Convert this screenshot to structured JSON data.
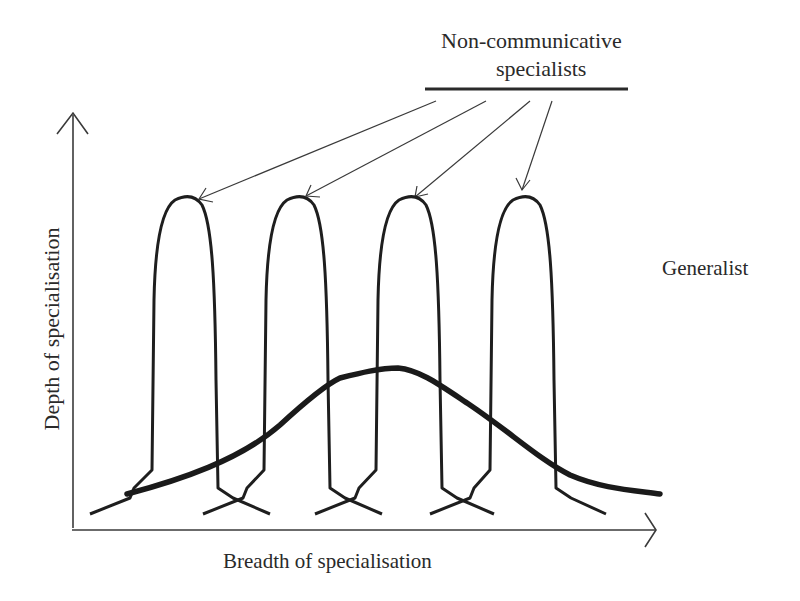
{
  "diagram": {
    "title": {
      "line1": "Non-communicative",
      "line2": "specialists"
    },
    "generalist_label": "Generalist",
    "x_axis_label": "Breadth of specialisation",
    "y_axis_label": "Depth of specialisation",
    "specialist_count": 4,
    "line_color": "#1e1e1e",
    "background": "#ffffff"
  }
}
